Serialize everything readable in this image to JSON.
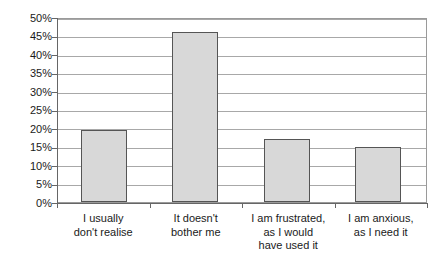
{
  "chart_data": {
    "type": "bar",
    "title": "",
    "subtitle": "",
    "xlabel": "",
    "ylabel": "",
    "ylim": [
      0,
      50
    ],
    "ytick_step": 5,
    "grid": true,
    "legend": false,
    "y_tick_labels": [
      "50%",
      "45%",
      "40%",
      "35%",
      "30%",
      "25%",
      "20%",
      "15%",
      "10%",
      "5%",
      "0%"
    ],
    "categories": [
      "I usually don't realise",
      "It doesn't bother me",
      "I am frustrated, as I would have used it",
      "I am anxious, as I need it"
    ],
    "category_label_lines": [
      [
        "I usually",
        "don't realise"
      ],
      [
        "It doesn't",
        "bother me"
      ],
      [
        "I am frustrated,",
        "as I would",
        "have used it"
      ],
      [
        "I am anxious,",
        "as I need it"
      ]
    ],
    "values": [
      20,
      47,
      17.5,
      15.3
    ],
    "value_labels": [
      "20%",
      "47%",
      "17.5%",
      "15.3%"
    ],
    "series": [
      {
        "name": "Response share",
        "values": [
          20,
          47,
          17.5,
          15.3
        ]
      }
    ],
    "colors": {
      "bar_fill": "#d8d8d8",
      "bar_border": "#555555",
      "gridline": "#a8a8a8",
      "axis": "#666666",
      "plot_border": "#9a9a9a",
      "background": "#ffffff",
      "text": "#1a1a1a"
    }
  }
}
